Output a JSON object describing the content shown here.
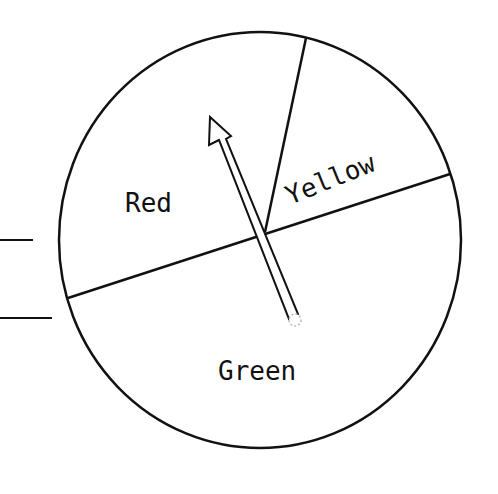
{
  "spinner": {
    "sections": [
      {
        "label": "Red"
      },
      {
        "label": "Yellow"
      },
      {
        "label": "Green"
      }
    ]
  },
  "colors": {
    "stroke": "#111111",
    "background": "#ffffff"
  }
}
